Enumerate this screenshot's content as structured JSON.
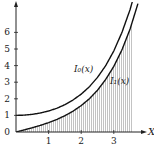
{
  "chart_data": {
    "type": "line",
    "title": "",
    "xlabel": "X",
    "ylabel": "",
    "xlim": [
      0,
      3.9
    ],
    "ylim": [
      0,
      7.2
    ],
    "x_ticks": [
      1,
      2,
      3
    ],
    "x_tick_labels": [
      "1",
      "2",
      "3"
    ],
    "y_ticks": [
      0,
      1,
      2,
      3,
      4,
      5,
      6
    ],
    "y_tick_labels": [
      "0",
      "1",
      "2",
      "3",
      "4",
      "5",
      "6"
    ],
    "grid": false,
    "legend": "none",
    "shaded_region": {
      "under_series": "I1",
      "x_from": 0,
      "x_to": 3.6,
      "style": "vertical hatching"
    },
    "series": [
      {
        "name": "I0",
        "label": "I₀(x)",
        "x": [
          0,
          0.25,
          0.5,
          0.75,
          1.0,
          1.25,
          1.5,
          1.75,
          2.0,
          2.25,
          2.5,
          2.75,
          3.0,
          3.25,
          3.5,
          3.75
        ],
        "values": [
          1.0,
          1.016,
          1.063,
          1.146,
          1.266,
          1.428,
          1.647,
          1.93,
          2.28,
          2.724,
          3.29,
          3.994,
          4.881,
          5.999,
          7.378,
          9.118
        ]
      },
      {
        "name": "I1",
        "label": "I₁(x)",
        "x": [
          0,
          0.25,
          0.5,
          0.75,
          1.0,
          1.25,
          1.5,
          1.75,
          2.0,
          2.25,
          2.5,
          2.75,
          3.0,
          3.25,
          3.5,
          3.75
        ],
        "values": [
          0.0,
          0.126,
          0.258,
          0.401,
          0.565,
          0.755,
          0.982,
          1.256,
          1.591,
          2.002,
          2.517,
          3.162,
          3.953,
          4.948,
          6.206,
          7.795
        ]
      }
    ],
    "annotations": [
      {
        "text": "I₀(x)",
        "near_series": "I0",
        "x": 2.3
      },
      {
        "text": "I₁(x)",
        "near_series": "I1",
        "x": 2.9
      }
    ]
  }
}
